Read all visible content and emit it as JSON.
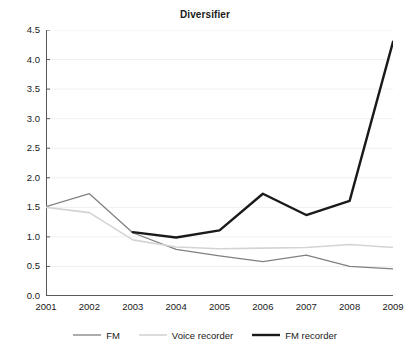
{
  "chart_data": {
    "type": "line",
    "title": "Diversifier",
    "xlabel": "",
    "ylabel": "",
    "categories": [
      "2001",
      "2002",
      "2003",
      "2004",
      "2005",
      "2006",
      "2007",
      "2008",
      "2009"
    ],
    "x": [
      2001,
      2002,
      2003,
      2004,
      2005,
      2006,
      2007,
      2008,
      2009
    ],
    "ylim": [
      0.0,
      4.5
    ],
    "ytick_step": 0.5,
    "ytick_labels": [
      "4.5",
      "4.0",
      "3.5",
      "3.0",
      "2.5",
      "2.0",
      "1.5",
      "1.0",
      "0.5",
      "0.0"
    ],
    "ytick_values": [
      4.5,
      4.0,
      3.5,
      3.0,
      2.5,
      2.0,
      1.5,
      1.0,
      0.5,
      0.0
    ],
    "grid": "horizontal",
    "grid_color": "#f0f0f0",
    "background": "#ffffff",
    "legend_position": "bottom",
    "series": [
      {
        "name": "FM",
        "color": "#808080",
        "width": 1.3,
        "values": [
          1.51,
          1.73,
          1.07,
          0.79,
          0.68,
          0.58,
          0.69,
          0.5,
          0.46
        ]
      },
      {
        "name": "Voice recorder",
        "color": "#d4d4d4",
        "width": 1.6,
        "values": [
          1.5,
          1.41,
          0.95,
          0.83,
          0.8,
          0.81,
          0.82,
          0.87,
          0.82
        ]
      },
      {
        "name": "FM recorder",
        "color": "#1a1a1a",
        "width": 2.4,
        "values": [
          null,
          null,
          1.08,
          0.99,
          1.11,
          1.73,
          1.37,
          1.61,
          4.3
        ]
      }
    ]
  },
  "legend": {
    "items": [
      {
        "label": "FM"
      },
      {
        "label": "Voice recorder"
      },
      {
        "label": "FM recorder"
      }
    ]
  },
  "axes": {
    "axis_color": "#595959"
  }
}
